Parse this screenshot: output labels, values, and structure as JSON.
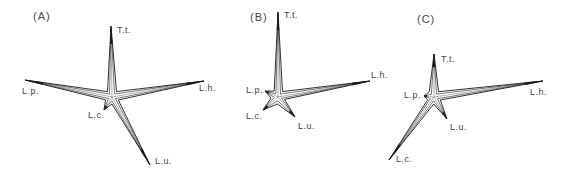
{
  "figure": {
    "stroke_color": "#1a1a1a",
    "text_color": "#444444",
    "panels": [
      {
        "id": "A",
        "label": "(A)",
        "label_pos": [
          33,
          11
        ],
        "center": [
          112,
          97
        ],
        "arms": [
          {
            "name": "T.t.",
            "tip": [
              111,
              26
            ],
            "label_pos": [
              117,
              26
            ]
          },
          {
            "name": "L.h.",
            "tip": [
              204,
              81
            ],
            "label_pos": [
              199,
              84
            ]
          },
          {
            "name": "L.u.",
            "tip": [
              150,
              165
            ],
            "label_pos": [
              155,
              157
            ]
          },
          {
            "name": "L.c.",
            "tip": [
              104,
              110
            ],
            "label_pos": [
              88,
              111
            ]
          },
          {
            "name": "L.p.",
            "tip": [
              25,
              80
            ],
            "label_pos": [
              22,
              87
            ]
          }
        ]
      },
      {
        "id": "B",
        "label": "(B)",
        "label_pos": [
          250,
          12
        ],
        "center": [
          278,
          97
        ],
        "arms": [
          {
            "name": "T.t.",
            "tip": [
              278,
              12
            ],
            "label_pos": [
              284,
              11
            ]
          },
          {
            "name": "L.h.",
            "tip": [
              370,
              81
            ],
            "label_pos": [
              371,
              71
            ]
          },
          {
            "name": "L.u.",
            "tip": [
              295,
              117
            ],
            "label_pos": [
              298,
              122
            ]
          },
          {
            "name": "L.c.",
            "tip": [
              263,
              110
            ],
            "label_pos": [
              246,
              112
            ]
          },
          {
            "name": "L.p.",
            "tip": [
              265,
              91
            ],
            "label_pos": [
              246,
              86
            ]
          }
        ]
      },
      {
        "id": "C",
        "label": "(C)",
        "label_pos": [
          417,
          14
        ],
        "center": [
          434,
          97
        ],
        "arms": [
          {
            "name": "T.t.",
            "tip": [
              434,
              54
            ],
            "label_pos": [
              441,
              55
            ]
          },
          {
            "name": "L.h.",
            "tip": [
              543,
              81
            ],
            "label_pos": [
              530,
              88
            ]
          },
          {
            "name": "L.u.",
            "tip": [
              447,
              119
            ],
            "label_pos": [
              450,
              123
            ]
          },
          {
            "name": "L.c.",
            "tip": [
              389,
              160
            ],
            "label_pos": [
              396,
              155
            ]
          },
          {
            "name": "L.p.",
            "tip": [
              424,
              96
            ],
            "label_pos": [
              404,
              91
            ]
          }
        ]
      }
    ]
  }
}
